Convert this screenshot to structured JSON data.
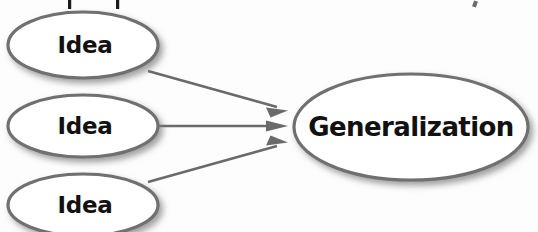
{
  "diagram": {
    "type": "concept-map",
    "background_color": "#fdfdfd",
    "stroke_color": "#6f6f6f",
    "text_color": "#111111",
    "arrow_color": "#6a6a6a",
    "nodes": [
      {
        "id": "idea-1",
        "label": "Idea",
        "shape": "ellipse",
        "cx": 83,
        "cy": 45,
        "rx": 75,
        "ry": 33
      },
      {
        "id": "idea-2",
        "label": "Idea",
        "shape": "ellipse",
        "cx": 83,
        "cy": 126,
        "rx": 75,
        "ry": 31
      },
      {
        "id": "idea-3",
        "label": "Idea",
        "shape": "ellipse",
        "cx": 83,
        "cy": 205,
        "rx": 75,
        "ry": 31
      },
      {
        "id": "generalization",
        "label": "Generalization",
        "shape": "ellipse",
        "cx": 411,
        "cy": 127,
        "rx": 117,
        "ry": 53
      }
    ],
    "edges": [
      {
        "id": "edge-1",
        "from": "idea-1",
        "to": "generalization",
        "x1": 148,
        "y1": 71,
        "x2": 287,
        "y2": 110
      },
      {
        "id": "edge-2",
        "from": "idea-2",
        "to": "generalization",
        "x1": 158,
        "y1": 126,
        "x2": 287,
        "y2": 126
      },
      {
        "id": "edge-3",
        "from": "idea-3",
        "to": "generalization",
        "x1": 148,
        "y1": 182,
        "x2": 287,
        "y2": 143
      }
    ],
    "cropped_text_fragments": [
      {
        "id": "frag-1",
        "x": 68,
        "y": 0,
        "width": 3,
        "height": 9
      },
      {
        "id": "frag-2",
        "x": 116,
        "y": 0,
        "width": 3,
        "height": 9
      },
      {
        "id": "frag-3",
        "x": 473,
        "y": 1,
        "width": 4,
        "height": 6
      }
    ]
  }
}
